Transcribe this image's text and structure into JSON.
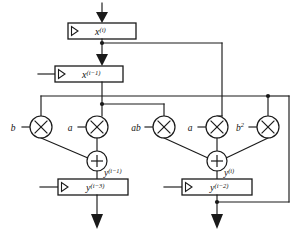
{
  "diagram": {
    "type": "block-diagram",
    "input": {
      "name": "primary-input",
      "arrow": "down-arrow-filled"
    },
    "registers": [
      {
        "id": "reg-xi",
        "base": "x",
        "sup": "(i)",
        "label": "x(i)",
        "clock_icon": "clock-triangle-icon",
        "x": 68,
        "y": 23,
        "w": 68,
        "h": 16,
        "has_clock_input_wire": false
      },
      {
        "id": "reg-xi1",
        "base": "x",
        "sup": "(i−1)",
        "label": "x(i-1)",
        "clock_icon": "clock-triangle-icon",
        "x": 55,
        "y": 66,
        "w": 68,
        "h": 16,
        "has_clock_input_wire": true
      },
      {
        "id": "reg-yi3",
        "base": "y",
        "sup": "(i−3)",
        "label": "y(i-3)",
        "clock_icon": "clock-triangle-icon",
        "x": 58,
        "y": 179,
        "w": 70,
        "h": 16,
        "has_clock_input_wire": true
      },
      {
        "id": "reg-yi2",
        "base": "y",
        "sup": "(i−2)",
        "label": "y(i-2)",
        "clock_icon": "clock-triangle-icon",
        "x": 182,
        "y": 179,
        "w": 70,
        "h": 16,
        "has_clock_input_wire": true
      }
    ],
    "multipliers": [
      {
        "id": "mul-b",
        "coef_base": "b",
        "coef_sup": "",
        "coef_label": "b",
        "cx": 41,
        "cy": 127,
        "r": 11,
        "glyph": "multiply-x-icon"
      },
      {
        "id": "mul-a1",
        "coef_base": "a",
        "coef_sup": "",
        "coef_label": "a",
        "cx": 97,
        "cy": 127,
        "r": 11,
        "glyph": "multiply-x-icon"
      },
      {
        "id": "mul-ab",
        "coef_base": "ab",
        "coef_sup": "",
        "coef_label": "ab",
        "cx": 164,
        "cy": 127,
        "r": 11,
        "glyph": "multiply-x-icon"
      },
      {
        "id": "mul-a2",
        "coef_base": "a",
        "coef_sup": "",
        "coef_label": "a",
        "cx": 217,
        "cy": 127,
        "r": 11,
        "glyph": "multiply-x-icon"
      },
      {
        "id": "mul-b2",
        "coef_base": "b",
        "coef_sup": "2",
        "coef_label": "b2",
        "cx": 268,
        "cy": 127,
        "r": 11,
        "glyph": "multiply-x-icon"
      }
    ],
    "adders": [
      {
        "id": "add-left",
        "cx": 97,
        "cy": 161,
        "r": 10,
        "glyph": "plus-icon"
      },
      {
        "id": "add-right",
        "cx": 217,
        "cy": 161,
        "r": 10,
        "glyph": "plus-icon"
      }
    ],
    "signal_labels": [
      {
        "id": "sig-yi1",
        "base": "y",
        "sup": "(i−1)",
        "label": "y(i-1)",
        "x": 104,
        "y": 176
      },
      {
        "id": "sig-yi",
        "base": "y",
        "sup": "(i)",
        "label": "y(i)",
        "x": 224,
        "y": 176
      }
    ],
    "outputs": [
      {
        "id": "out-left",
        "arrow": "down-arrow-filled"
      },
      {
        "id": "out-right",
        "arrow": "down-arrow-filled"
      }
    ],
    "junction_dots": [
      {
        "id": "dot-xi-out",
        "cx": 102,
        "cy": 43
      },
      {
        "id": "dot-xi1-out",
        "cx": 102,
        "cy": 104
      },
      {
        "id": "dot-b2-top",
        "cx": 268,
        "cy": 96
      },
      {
        "id": "dot-yi2-out",
        "cx": 217,
        "cy": 202
      }
    ],
    "colors": {
      "line": "#1a1a1a",
      "fill": "#ffffff",
      "text": "#111111"
    }
  }
}
